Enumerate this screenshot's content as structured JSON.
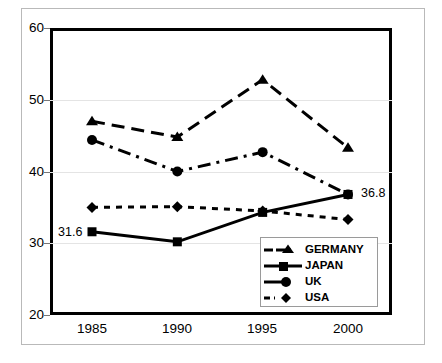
{
  "chart_data": {
    "type": "line",
    "title": "",
    "xlabel": "",
    "ylabel": "",
    "categories": [
      "1985",
      "1990",
      "1995",
      "2000"
    ],
    "x": [
      1985,
      1990,
      1995,
      2000
    ],
    "ylim": [
      20,
      60
    ],
    "yticks": [
      20,
      30,
      40,
      50,
      60
    ],
    "ytick_labels": [
      "20",
      "30",
      "40",
      "50",
      "60"
    ],
    "grid": true,
    "legend_position": "inside-bottom-right",
    "series": [
      {
        "name": "GERMANY",
        "marker": "triangle",
        "line_style": "dashed",
        "color": "#000000",
        "values": [
          47.0,
          44.8,
          52.8,
          43.3
        ]
      },
      {
        "name": "JAPAN",
        "marker": "square",
        "line_style": "solid",
        "color": "#000000",
        "values": [
          31.6,
          30.2,
          34.3,
          36.8
        ]
      },
      {
        "name": "UK",
        "marker": "circle",
        "line_style": "dash-dot",
        "color": "#000000",
        "values": [
          44.4,
          40.0,
          42.7,
          36.8
        ]
      },
      {
        "name": "USA",
        "marker": "diamond",
        "line_style": "dotted",
        "color": "#000000",
        "values": [
          35.0,
          35.1,
          34.5,
          33.3
        ]
      }
    ],
    "annotations": [
      {
        "text": "31.6",
        "series": "JAPAN",
        "x": "1985",
        "value": 31.6
      },
      {
        "text": "36.8",
        "series": "JAPAN",
        "x": "2000",
        "value": 36.8
      }
    ]
  },
  "axis": {
    "y_labels": [
      "60",
      "50",
      "40",
      "30",
      "20"
    ],
    "x_labels": [
      "1985",
      "1990",
      "1995",
      "2000"
    ]
  },
  "legend": {
    "items": [
      {
        "label": "GERMANY",
        "marker": "triangle-marker",
        "line": "dashed"
      },
      {
        "label": "JAPAN",
        "marker": "square-marker",
        "line": "solid"
      },
      {
        "label": "UK",
        "marker": "circle-marker",
        "line": "dash-dot"
      },
      {
        "label": "USA",
        "marker": "diamond-marker",
        "line": "dotted"
      }
    ]
  },
  "labels": {
    "japan_first": "31.6",
    "japan_last": "36.8"
  },
  "caption": {
    "text": ""
  }
}
